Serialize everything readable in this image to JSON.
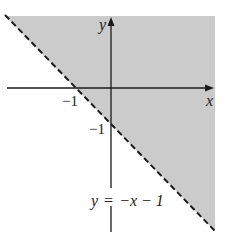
{
  "figure": {
    "type": "inequality-graph",
    "shaded_region": "y > -x - 1",
    "boundary": {
      "equation_label": "y = −x − 1",
      "style": "dashed"
    },
    "axes": {
      "x_label": "x",
      "y_label": "y"
    },
    "ticks": {
      "x_intercept_label": "−1",
      "y_intercept_label": "−1"
    },
    "colors": {
      "shade": "#cbcbcb",
      "line": "#1a1a1a",
      "background": "#ffffff"
    }
  },
  "label_parts": {
    "y": "y",
    "eq": "=",
    "rhs": "−x − 1"
  }
}
